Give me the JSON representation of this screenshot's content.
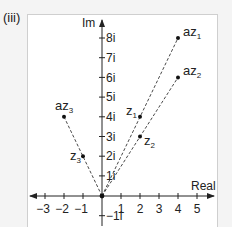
{
  "panel_label": "(iii)",
  "axes": {
    "x_label": "Real",
    "y_label": "Im",
    "x_ticks": [
      "−3",
      "−2",
      "−1",
      "1",
      "2",
      "3",
      "4",
      "5"
    ],
    "y_ticks": [
      "8i",
      "7i",
      "6i",
      "5i",
      "4i",
      "3i",
      "2i",
      "1i",
      "−1i"
    ]
  },
  "points": {
    "z1": {
      "label": "z",
      "sub": "1",
      "re": 2,
      "im": 4
    },
    "z2": {
      "label": "z",
      "sub": "2",
      "re": 2,
      "im": 3
    },
    "z3": {
      "label": "z",
      "sub": "3",
      "re": -1,
      "im": 2
    },
    "az1": {
      "label": "az",
      "sub": "1",
      "re": 4,
      "im": 8
    },
    "az2": {
      "label": "az",
      "sub": "2",
      "re": 4,
      "im": 6
    },
    "az3": {
      "label": "az",
      "sub": "3",
      "re": -2,
      "im": 4
    }
  },
  "colors": {
    "axis": "#222222",
    "dash": "#333333",
    "point": "#111111"
  }
}
